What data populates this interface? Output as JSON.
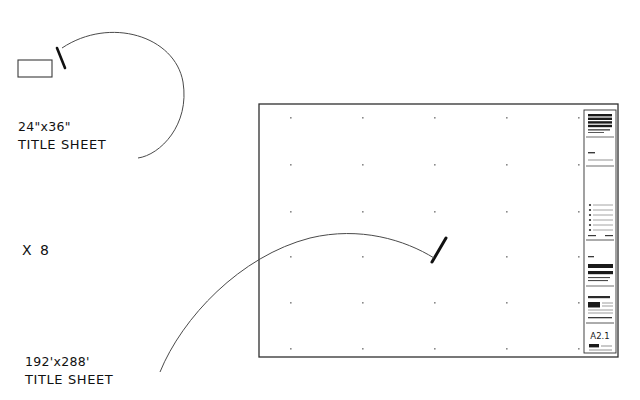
{
  "drawing": {
    "title": "Sheet Scale Comparison",
    "background_color": "#ffffff",
    "line_color": "#333333",
    "text_color": "#111111",
    "grid_dot_color": "#8a8a8a"
  },
  "small_sheet": {
    "label_dimension": "24\"x36\"",
    "label_name": "TITLE SHEET",
    "shape": "rectangle"
  },
  "multiplier": {
    "label": "X 8"
  },
  "large_sheet": {
    "label_dimension": "192'x288'",
    "label_name": "TITLE SHEET",
    "shape": "rectangle",
    "grid_columns": 5,
    "grid_rows": 6
  },
  "title_block": {
    "sheet_number": "A2.1",
    "firm_name_lines": [
      "BARRETTO",
      "WINSTON",
      "ARCHITECTS",
      "PLANNERS"
    ],
    "firm_address": "ARCHITECTURE  PLANNING",
    "project_owner_lines": [
      "THE URBAN",
      "LANDING COMPANY"
    ],
    "project_sub_lines": [
      "URBAN  LANDING  MIXED  USE",
      "SERIAL  BUILDING  PHASE"
    ],
    "field_label_project": "PROJECT",
    "field_label_revisions": "REVISIONS",
    "field_label_issue": "ISSUE",
    "field_label_sheet_title": "SHEET TITLE",
    "field_label_drawn": "DRAWN BY",
    "revision_rows": 6,
    "sheet_title_text": "TITLE SHEET"
  }
}
